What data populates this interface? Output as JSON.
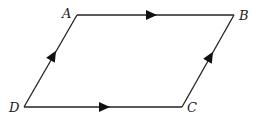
{
  "diagram": {
    "type": "parallelogram",
    "vertices": [
      {
        "label": "A",
        "x": 77,
        "y": 15
      },
      {
        "label": "B",
        "x": 234,
        "y": 15
      },
      {
        "label": "C",
        "x": 182,
        "y": 107
      },
      {
        "label": "D",
        "x": 24,
        "y": 107
      }
    ],
    "edges": [
      {
        "from": "A",
        "to": "B",
        "arrow": "toward B"
      },
      {
        "from": "D",
        "to": "C",
        "arrow": "toward C"
      },
      {
        "from": "D",
        "to": "A",
        "arrow": "toward A"
      },
      {
        "from": "C",
        "to": "B",
        "arrow": "toward B"
      }
    ],
    "labels": {
      "A": "A",
      "B": "B",
      "C": "C",
      "D": "D"
    },
    "colors": {
      "stroke": "#222222",
      "background": "#ffffff"
    }
  }
}
